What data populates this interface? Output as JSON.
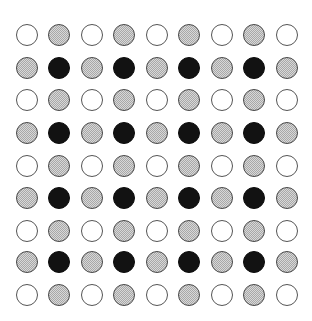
{
  "figure": {
    "background_color": "#ffffff",
    "width": 312,
    "height": 321
  },
  "grid": {
    "columns": 9,
    "rows": 9,
    "circle_diameter": 22,
    "column_centers_x": [
      27,
      59,
      92,
      124,
      157,
      189,
      222,
      254,
      287
    ],
    "row_centers_y": [
      35,
      68,
      100,
      133,
      166,
      198,
      231,
      262,
      295
    ],
    "states": [
      "white",
      "gray",
      "black"
    ],
    "state_colors": {
      "white": "#ffffff",
      "gray": "#a8a8a8",
      "black": "#121212",
      "outline": "#555555"
    },
    "cells": [
      [
        "white",
        "gray",
        "white",
        "gray",
        "white",
        "gray",
        "white",
        "gray",
        "white"
      ],
      [
        "gray",
        "black",
        "gray",
        "black",
        "gray",
        "black",
        "gray",
        "black",
        "gray"
      ],
      [
        "white",
        "gray",
        "white",
        "gray",
        "white",
        "gray",
        "white",
        "gray",
        "white"
      ],
      [
        "gray",
        "black",
        "gray",
        "black",
        "gray",
        "black",
        "gray",
        "black",
        "gray"
      ],
      [
        "white",
        "gray",
        "white",
        "gray",
        "white",
        "gray",
        "white",
        "gray",
        "white"
      ],
      [
        "gray",
        "black",
        "gray",
        "black",
        "gray",
        "black",
        "gray",
        "black",
        "gray"
      ],
      [
        "white",
        "gray",
        "white",
        "gray",
        "white",
        "gray",
        "white",
        "gray",
        "white"
      ],
      [
        "gray",
        "black",
        "gray",
        "black",
        "gray",
        "black",
        "gray",
        "black",
        "gray"
      ],
      [
        "white",
        "gray",
        "white",
        "gray",
        "white",
        "gray",
        "white",
        "gray",
        "white"
      ]
    ]
  }
}
